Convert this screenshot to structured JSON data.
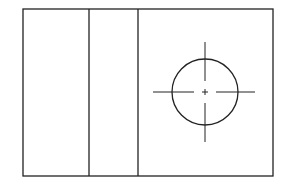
{
  "drawing": {
    "type": "orthographic-view",
    "stroke_color": "#222222",
    "background": "#ffffff",
    "outline": {
      "x": 23,
      "y": 9,
      "width": 250,
      "height": 167
    },
    "dividers_x": [
      89,
      138
    ],
    "hole": {
      "cx": 205,
      "cy": 92,
      "r": 33,
      "centerline_h": {
        "x1": 153,
        "x2": 255
      },
      "centerline_v": {
        "y1": 42,
        "y2": 142
      }
    }
  }
}
